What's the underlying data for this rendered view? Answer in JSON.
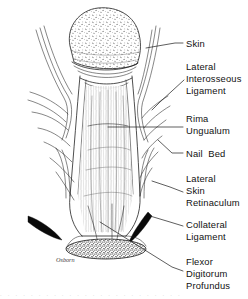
{
  "figure": {
    "background_color": "#ffffff",
    "ink_color": "#222222",
    "label_color": "#111111",
    "signature": "Osborn",
    "footer_text": ". . . . . . . . . . . . . . . . . . . . . . . ."
  },
  "labels": [
    {
      "id": "skin",
      "lines": [
        "Skin"
      ],
      "text_x": 186,
      "line_ys": [
        47
      ],
      "leader": "M183,43 L175,43 L146,48"
    },
    {
      "id": "lateral-interosseous-ligament",
      "lines": [
        "Lateral",
        "Interosseous",
        "Ligament"
      ],
      "text_x": 186,
      "line_ys": [
        70,
        82,
        94
      ],
      "leader": "M184,80 L160,102 L152,110"
    },
    {
      "id": "rima-ungualum",
      "lines": [
        "Rima",
        "Ungualum"
      ],
      "text_x": 186,
      "line_ys": [
        122,
        134
      ],
      "leader": "M183,127 L108,127"
    },
    {
      "id": "nail-bed",
      "lines": [
        "Nail  Bed"
      ],
      "text_x": 186,
      "line_ys": [
        157
      ],
      "leader": "M183,153 L172,153 L158,140"
    },
    {
      "id": "lateral-skin-retinaculum",
      "lines": [
        "Lateral",
        "Skin",
        "Retinaculum"
      ],
      "text_x": 186,
      "line_ys": [
        182,
        194,
        206
      ],
      "leader": "M183,192 L170,187 L152,181"
    },
    {
      "id": "collateral-ligament",
      "lines": [
        "Collateral",
        "Ligament"
      ],
      "text_x": 186,
      "line_ys": [
        228,
        240
      ],
      "leader": "M183,226 L170,222 L150,216"
    },
    {
      "id": "flexor-digitorum-profundus",
      "lines": [
        "Flexor",
        "Digitorum",
        "Profundus"
      ],
      "text_x": 186,
      "line_ys": [
        265,
        277,
        289
      ],
      "leader": "M183,271 L172,267 L100,222"
    }
  ]
}
